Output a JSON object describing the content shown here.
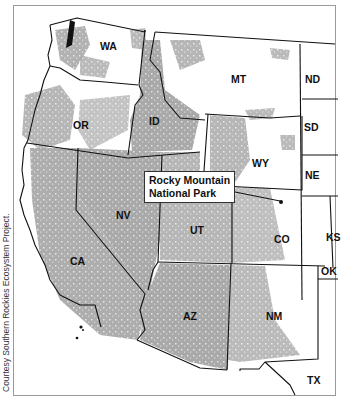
{
  "map": {
    "colors": {
      "land_background": "#ffffff",
      "protected_area": "#a9a9a9",
      "boundary": "#111111",
      "frame": "#9a9a9a"
    },
    "states": [
      {
        "code": "WA",
        "x": 100,
        "y": 47
      },
      {
        "code": "OR",
        "x": 73,
        "y": 120
      },
      {
        "code": "ID",
        "x": 149,
        "y": 116
      },
      {
        "code": "MT",
        "x": 231,
        "y": 74
      },
      {
        "code": "ND",
        "x": 305,
        "y": 74
      },
      {
        "code": "SD",
        "x": 304,
        "y": 122
      },
      {
        "code": "WY",
        "x": 252,
        "y": 158
      },
      {
        "code": "NE",
        "x": 305,
        "y": 170
      },
      {
        "code": "NV",
        "x": 116,
        "y": 210
      },
      {
        "code": "UT",
        "x": 190,
        "y": 225
      },
      {
        "code": "CO",
        "x": 274,
        "y": 234
      },
      {
        "code": "KS",
        "x": 326,
        "y": 232
      },
      {
        "code": "OK",
        "x": 321,
        "y": 266
      },
      {
        "code": "CA",
        "x": 70,
        "y": 256
      },
      {
        "code": "AZ",
        "x": 183,
        "y": 311
      },
      {
        "code": "NM",
        "x": 266,
        "y": 311
      },
      {
        "code": "TX",
        "x": 307,
        "y": 375
      }
    ],
    "callout": {
      "line1": "Rocky Mountain",
      "line2": "National Park",
      "target_x": 281,
      "target_y": 202
    },
    "credit": "Courtesy Southern Rockies Ecosystem Project."
  }
}
